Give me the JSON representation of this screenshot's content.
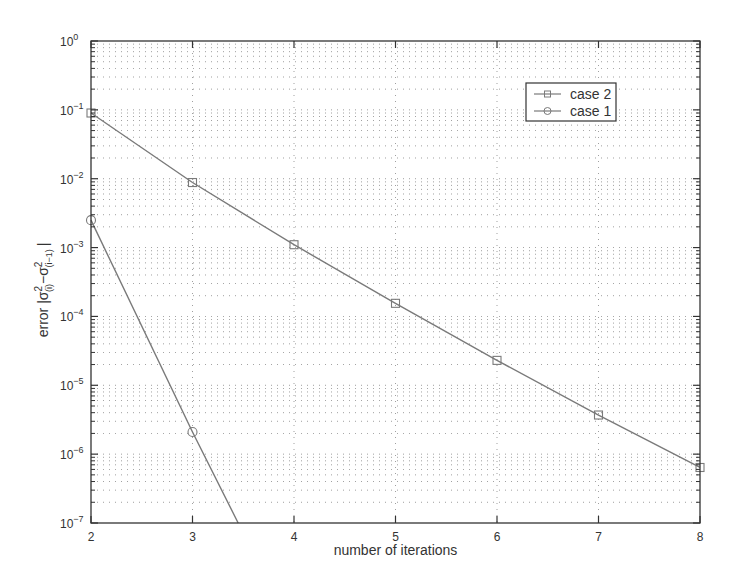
{
  "chart_data": {
    "type": "line",
    "title": "",
    "xlabel": "number of iterations",
    "ylabel": "error |σ²(i) − σ²(i−1)|",
    "ylabel_parts": {
      "prefix": "error |σ",
      "sub1": "(i)",
      "mid": "−σ",
      "sub2": "(i−1)",
      "suffix": "|"
    },
    "xscale": "linear",
    "yscale": "log",
    "xlim": [
      2,
      8
    ],
    "ylim": [
      1e-07,
      1
    ],
    "x_ticks": [
      2,
      3,
      4,
      5,
      6,
      7,
      8
    ],
    "y_ticks": [
      {
        "value": 1,
        "exp": "0"
      },
      {
        "value": 0.1,
        "exp": "−1"
      },
      {
        "value": 0.01,
        "exp": "−2"
      },
      {
        "value": 0.001,
        "exp": "−3"
      },
      {
        "value": 0.0001,
        "exp": "−4"
      },
      {
        "value": 1e-05,
        "exp": "−5"
      },
      {
        "value": 1e-06,
        "exp": "−6"
      },
      {
        "value": 1e-07,
        "exp": "−7"
      }
    ],
    "grid": true,
    "legend_position": "upper right",
    "series": [
      {
        "name": "case 2",
        "marker": "square",
        "x": [
          2,
          3,
          4,
          5,
          6,
          7,
          8
        ],
        "values": [
          0.09,
          0.0088,
          0.0011,
          0.000155,
          2.3e-05,
          3.7e-06,
          6.4e-07
        ]
      },
      {
        "name": "case 1",
        "marker": "circle",
        "x": [
          2,
          3
        ],
        "values": [
          0.0025,
          2.1e-06
        ],
        "line_extends_to": {
          "x": 3.45,
          "y": 1e-07
        }
      }
    ]
  },
  "legend": {
    "items": [
      {
        "label": "case 2",
        "marker": "square"
      },
      {
        "label": "case 1",
        "marker": "circle"
      }
    ]
  },
  "colors": {
    "series_line": "#7a7a7a",
    "axes": "#333333",
    "grid": "#555555",
    "text": "#333333"
  }
}
